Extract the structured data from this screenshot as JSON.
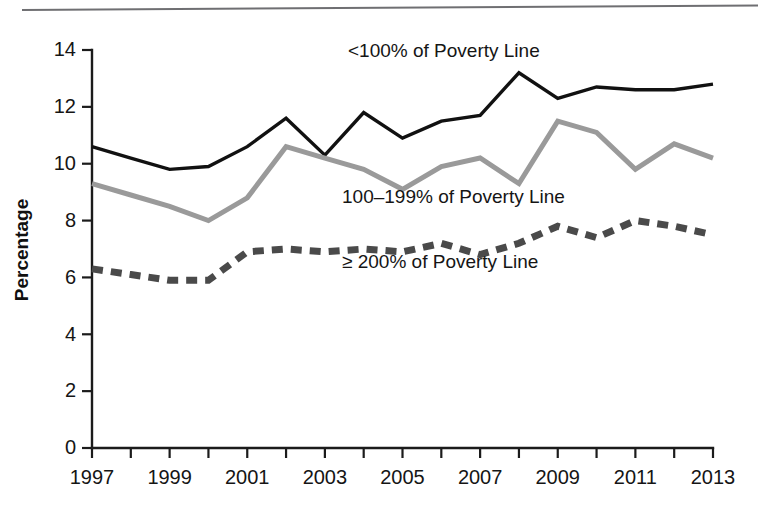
{
  "figure": {
    "background_color": "#ffffff",
    "rule_color": "#6f6f72",
    "has_top_rule": true
  },
  "axis": {
    "y_title": "Percentage",
    "y_ticks": [
      "0",
      "2",
      "4",
      "6",
      "8",
      "10",
      "12",
      "14"
    ],
    "x_ticks_labeled": [
      "1997",
      "1999",
      "2001",
      "2003",
      "2005",
      "2007",
      "2009",
      "2011",
      "2013"
    ]
  },
  "series_labels": {
    "under_100": "<100% of Poverty Line",
    "mid_100_199": "100–199% of Poverty Line",
    "over_200": "≥ 200% of Poverty Line"
  },
  "colors": {
    "under_100": "#111111",
    "mid_100_199": "#9a9a9a",
    "over_200": "#4a4a4a",
    "axis": "#1b1b1b",
    "text": "#151515"
  },
  "chart_data": {
    "type": "line",
    "title": "",
    "xlabel": "",
    "ylabel": "Percentage",
    "xlim": [
      1997,
      2013
    ],
    "ylim": [
      0,
      14
    ],
    "ytick_step": 2,
    "xtick_step": 1,
    "xtick_label_step": 2,
    "grid": false,
    "legend": "inline-annotations",
    "x": [
      1997,
      1998,
      1999,
      2000,
      2001,
      2002,
      2003,
      2004,
      2005,
      2006,
      2007,
      2008,
      2009,
      2010,
      2011,
      2012,
      2013
    ],
    "series": [
      {
        "name": "<100% of Poverty Line",
        "style": "solid",
        "color": "#111111",
        "values": [
          10.6,
          10.2,
          9.8,
          9.9,
          10.6,
          11.6,
          10.3,
          11.8,
          10.9,
          11.5,
          11.7,
          13.2,
          12.3,
          12.7,
          12.6,
          12.6,
          12.8
        ]
      },
      {
        "name": "100–199% of Poverty Line",
        "style": "solid",
        "color": "#9a9a9a",
        "values": [
          9.3,
          8.9,
          8.5,
          8.0,
          8.8,
          10.6,
          10.2,
          9.8,
          9.1,
          9.9,
          10.2,
          9.3,
          11.5,
          11.1,
          9.8,
          10.7,
          10.2
        ]
      },
      {
        "name": "≥ 200% of Poverty Line",
        "style": "dashed",
        "color": "#4a4a4a",
        "values": [
          6.3,
          6.1,
          5.9,
          5.9,
          6.9,
          7.0,
          6.9,
          7.0,
          6.9,
          7.2,
          6.8,
          7.2,
          7.8,
          7.4,
          8.0,
          7.8,
          7.5
        ]
      }
    ],
    "annotations": [
      {
        "text": "<100% of Poverty Line",
        "x": 2004.1,
        "y": 13.6
      },
      {
        "text": "100–199% of Poverty Line",
        "x": 2003.9,
        "y": 8.7
      },
      {
        "text": "≥ 200% of Poverty Line",
        "x": 2003.9,
        "y": 6.4
      }
    ]
  }
}
